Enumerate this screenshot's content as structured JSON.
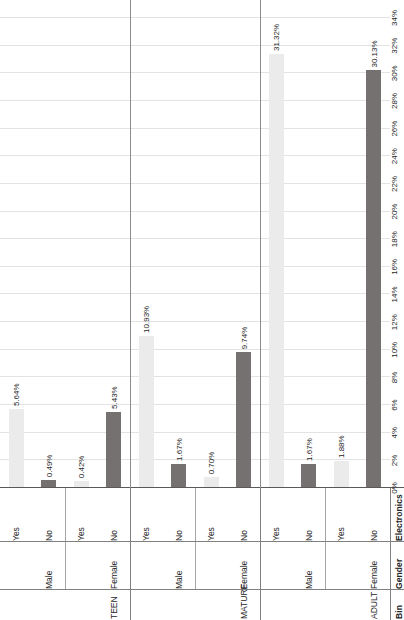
{
  "chart_data": {
    "type": "bar",
    "orientation": "horizontal",
    "title": "",
    "xlabel": "Percentage of Electronic Purchases",
    "ylabel": "",
    "xlim": [
      0,
      34
    ],
    "grid": true,
    "legend": "none",
    "tick_labels": [
      "0%",
      "2%",
      "4%",
      "6%",
      "8%",
      "10%",
      "12%",
      "14%",
      "16%",
      "18%",
      "20%",
      "22%",
      "24%",
      "26%",
      "28%",
      "30%",
      "32%",
      "34%"
    ],
    "tick_values": [
      0,
      2,
      4,
      6,
      8,
      10,
      12,
      14,
      16,
      18,
      20,
      22,
      24,
      26,
      28,
      30,
      32,
      34
    ],
    "group_headers": [
      "Bin",
      "Gender",
      "Electronics"
    ],
    "colors": {
      "no": "#757171",
      "yes": "#ebebeb",
      "axis": "#595959",
      "grid": "#e3e3e3",
      "text": "#262626"
    },
    "categories": [
      {
        "bin": "ADULT",
        "gender": "Female",
        "electronics": "No",
        "value": 30.13,
        "label": "30.13%"
      },
      {
        "bin": "",
        "gender": "",
        "electronics": "Yes",
        "value": 1.88,
        "label": "1.88%"
      },
      {
        "bin": "",
        "gender": "Male",
        "electronics": "No",
        "value": 1.67,
        "label": "1.67%"
      },
      {
        "bin": "",
        "gender": "",
        "electronics": "Yes",
        "value": 31.32,
        "label": "31.32%"
      },
      {
        "bin": "MATURE",
        "gender": "Female",
        "electronics": "No",
        "value": 9.74,
        "label": "9.74%"
      },
      {
        "bin": "",
        "gender": "",
        "electronics": "Yes",
        "value": 0.7,
        "label": "0.70%"
      },
      {
        "bin": "",
        "gender": "Male",
        "electronics": "No",
        "value": 1.67,
        "label": "1.67%"
      },
      {
        "bin": "",
        "gender": "",
        "electronics": "Yes",
        "value": 10.93,
        "label": "10.93%"
      },
      {
        "bin": "TEEN",
        "gender": "Female",
        "electronics": "No",
        "value": 5.43,
        "label": "5.43%"
      },
      {
        "bin": "",
        "gender": "",
        "electronics": "Yes",
        "value": 0.42,
        "label": "0.42%"
      },
      {
        "bin": "",
        "gender": "Male",
        "electronics": "No",
        "value": 0.49,
        "label": "0.49%"
      },
      {
        "bin": "",
        "gender": "",
        "electronics": "Yes",
        "value": 5.64,
        "label": "5.64%"
      }
    ]
  }
}
